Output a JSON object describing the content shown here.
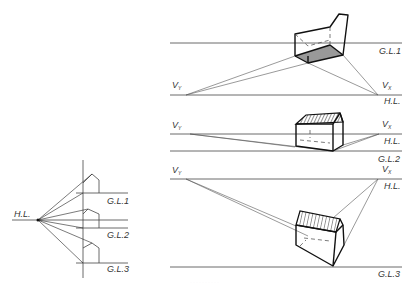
{
  "figure": {
    "left_panel": {
      "hl_label": "H.L.",
      "gl_labels": [
        "G.L.1",
        "G.L.2",
        "G.L.3"
      ]
    },
    "panel_1": {
      "vy_label": "V",
      "vy_sub": "Y",
      "vx_label": "V",
      "vx_sub": "X",
      "gl_label": "G.L.1",
      "hl_label": "H.L."
    },
    "panel_2": {
      "vy_label": "V",
      "vy_sub": "Y",
      "vx_label": "V",
      "vx_sub": "X",
      "hl_label": "H.L.",
      "gl_label": "G.L.2"
    },
    "panel_3": {
      "vy_label": "V",
      "vy_sub": "Y",
      "vx_label": "V",
      "vx_sub": "X",
      "hl_label": "H.L.",
      "gl_label": "G.L.3"
    },
    "caption": "··········",
    "colors": {
      "line": "#444444",
      "bold": "#111111",
      "shade": "#999999"
    }
  }
}
